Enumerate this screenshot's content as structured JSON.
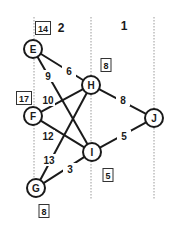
{
  "stages": [
    {
      "label": "2",
      "x": 61,
      "y": 28
    },
    {
      "label": "1",
      "x": 124,
      "y": 26
    }
  ],
  "stage_lines": [
    {
      "x": 34,
      "y1": 17,
      "y2": 198
    },
    {
      "x": 91,
      "y1": 17,
      "y2": 200
    },
    {
      "x": 154,
      "y1": 17,
      "y2": 200
    }
  ],
  "nodes": [
    {
      "id": "E",
      "label": "E",
      "x": 33,
      "y": 49
    },
    {
      "id": "F",
      "label": "F",
      "x": 33,
      "y": 116
    },
    {
      "id": "G",
      "label": "G",
      "x": 36,
      "y": 188
    },
    {
      "id": "H",
      "label": "H",
      "x": 91,
      "y": 85
    },
    {
      "id": "I",
      "label": "I",
      "x": 92,
      "y": 152
    },
    {
      "id": "J",
      "label": "J",
      "x": 154,
      "y": 118
    }
  ],
  "edges": [
    {
      "from": "E",
      "to": "H",
      "weight": "6",
      "lx": 69,
      "ly": 71
    },
    {
      "from": "E",
      "to": "I",
      "weight": "9",
      "lx": 48,
      "ly": 76
    },
    {
      "from": "F",
      "to": "H",
      "weight": "10",
      "lx": 48,
      "ly": 100
    },
    {
      "from": "F",
      "to": "I",
      "weight": "12",
      "lx": 48,
      "ly": 136
    },
    {
      "from": "G",
      "to": "H",
      "weight": "13",
      "lx": 49,
      "ly": 160
    },
    {
      "from": "G",
      "to": "I",
      "weight": "3",
      "lx": 70,
      "ly": 169
    },
    {
      "from": "H",
      "to": "J",
      "weight": "8",
      "lx": 123,
      "ly": 100
    },
    {
      "from": "I",
      "to": "J",
      "weight": "5",
      "lx": 124,
      "ly": 136
    }
  ],
  "value_boxes": [
    {
      "node": "E",
      "value": "14",
      "x": 43,
      "y": 28
    },
    {
      "node": "F",
      "value": "17",
      "x": 24,
      "y": 98
    },
    {
      "node": "H",
      "value": "8",
      "x": 106,
      "y": 65
    },
    {
      "node": "I",
      "value": "5",
      "x": 108,
      "y": 175
    },
    {
      "node": "G",
      "value": "8",
      "x": 44,
      "y": 211
    }
  ]
}
